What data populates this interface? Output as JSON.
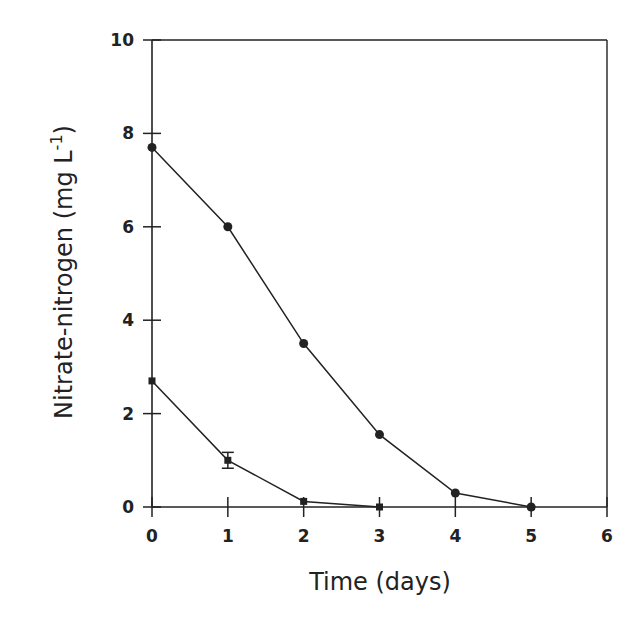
{
  "chart_data": {
    "type": "line",
    "title": "",
    "xlabel": "Time (days)",
    "ylabel": "Nitrate-nitrogen (mg L",
    "ylabel_superscript": "-1",
    "ylabel_close": ")",
    "xlim": [
      0,
      6
    ],
    "ylim": [
      0,
      10
    ],
    "x_ticks": [
      0,
      1,
      2,
      3,
      4,
      5,
      6
    ],
    "y_ticks": [
      0,
      2,
      4,
      6,
      8,
      10
    ],
    "grid": false,
    "legend": null,
    "series": [
      {
        "name": "circles",
        "marker": "circle",
        "x": [
          0,
          1,
          2,
          3,
          4,
          5
        ],
        "values": [
          7.7,
          6.0,
          3.5,
          1.55,
          0.3,
          0.0
        ],
        "error": [
          0,
          0,
          0,
          0,
          0,
          0
        ]
      },
      {
        "name": "squares",
        "marker": "square",
        "x": [
          0,
          1,
          2,
          3
        ],
        "values": [
          2.7,
          1.0,
          0.12,
          0.0
        ],
        "error": [
          0,
          0.17,
          0,
          0
        ]
      }
    ]
  },
  "colors": {
    "ink": "#222222",
    "background": "#ffffff"
  }
}
